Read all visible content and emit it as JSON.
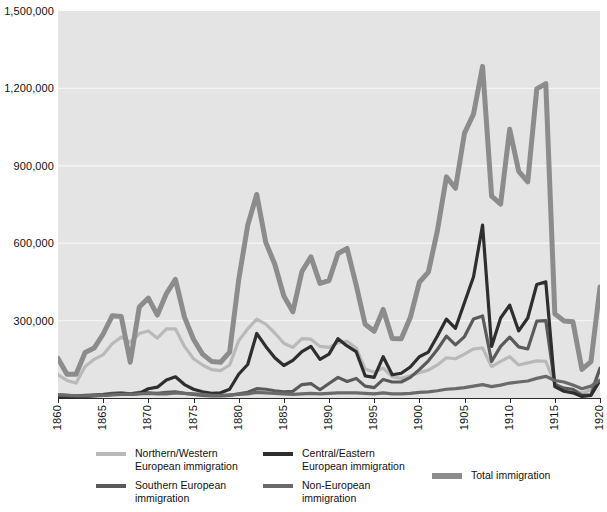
{
  "chart_data": {
    "type": "line",
    "title": "",
    "subtitle": "",
    "xlabel": "",
    "ylabel": "",
    "xlim": [
      1860,
      1920
    ],
    "ylim": [
      0,
      1500000
    ],
    "grid": "horizontal",
    "legend_position": "bottom",
    "y_ticks": [
      0,
      300000,
      600000,
      900000,
      1200000,
      1500000
    ],
    "y_tick_labels": [
      "",
      "300,000",
      "600,000",
      "900,000",
      "1,200,000",
      "1,500,000"
    ],
    "x_ticks": [
      1860,
      1865,
      1870,
      1875,
      1880,
      1885,
      1890,
      1895,
      1900,
      1905,
      1910,
      1915,
      1920
    ],
    "x_tick_labels": [
      "1860",
      "1865",
      "1870",
      "1875",
      "1880",
      "1885",
      "1890",
      "1895",
      "1900",
      "1905",
      "1910",
      "1915",
      "1920"
    ],
    "x": [
      1860,
      1861,
      1862,
      1863,
      1864,
      1865,
      1866,
      1867,
      1868,
      1869,
      1870,
      1871,
      1872,
      1873,
      1874,
      1875,
      1876,
      1877,
      1878,
      1879,
      1880,
      1881,
      1882,
      1883,
      1884,
      1885,
      1886,
      1887,
      1888,
      1889,
      1890,
      1891,
      1892,
      1893,
      1894,
      1895,
      1896,
      1897,
      1898,
      1899,
      1900,
      1901,
      1902,
      1903,
      1904,
      1905,
      1906,
      1907,
      1908,
      1909,
      1910,
      1911,
      1912,
      1913,
      1914,
      1915,
      1916,
      1917,
      1918,
      1919,
      1920
    ],
    "series": [
      {
        "name": "Northern/Western European immigration",
        "color": "#b9b9b9",
        "width": 3.2,
        "values": [
          90000,
          68000,
          58000,
          122000,
          150000,
          168000,
          210000,
          236000,
          216000,
          250000,
          260000,
          232000,
          268000,
          268000,
          200000,
          152000,
          128000,
          110000,
          106000,
          128000,
          222000,
          268000,
          306000,
          286000,
          252000,
          212000,
          196000,
          230000,
          228000,
          200000,
          196000,
          214000,
          220000,
          194000,
          112000,
          100000,
          116000,
          82000,
          76000,
          86000,
          98000,
          108000,
          128000,
          156000,
          152000,
          170000,
          190000,
          194000,
          122000,
          142000,
          160000,
          128000,
          136000,
          144000,
          142000,
          56000,
          34000,
          32000,
          18000,
          32000,
          112000
        ],
        "peak_year": 1882,
        "peak_value": 306000
      },
      {
        "name": "Southern European immigration",
        "color": "#5a5a5a",
        "width": 3.2,
        "values": [
          12000,
          10000,
          8000,
          10000,
          12000,
          14000,
          18000,
          20000,
          16000,
          22000,
          20000,
          18000,
          22000,
          24000,
          18000,
          14000,
          10000,
          8000,
          8000,
          10000,
          16000,
          22000,
          36000,
          34000,
          28000,
          24000,
          26000,
          52000,
          56000,
          32000,
          56000,
          80000,
          64000,
          76000,
          46000,
          40000,
          72000,
          62000,
          62000,
          80000,
          110000,
          144000,
          188000,
          240000,
          206000,
          238000,
          306000,
          318000,
          142000,
          200000,
          236000,
          198000,
          190000,
          298000,
          300000,
          52000,
          38000,
          34000,
          10000,
          12000,
          116000
        ],
        "peak_year": 1907,
        "peak_value": 318000
      },
      {
        "name": "Central/Eastern European immigration",
        "color": "#2e2e2e",
        "width": 3.2,
        "values": [
          6000,
          5000,
          4000,
          6000,
          8000,
          10000,
          14000,
          16000,
          14000,
          18000,
          36000,
          42000,
          70000,
          82000,
          52000,
          34000,
          24000,
          18000,
          20000,
          34000,
          92000,
          130000,
          250000,
          200000,
          156000,
          126000,
          146000,
          180000,
          200000,
          150000,
          170000,
          230000,
          202000,
          180000,
          86000,
          80000,
          160000,
          90000,
          96000,
          120000,
          160000,
          178000,
          240000,
          306000,
          270000,
          370000,
          470000,
          670000,
          200000,
          310000,
          360000,
          260000,
          310000,
          440000,
          450000,
          44000,
          26000,
          20000,
          6000,
          10000,
          68000
        ],
        "peak_year": 1907,
        "peak_value": 670000
      },
      {
        "name": "Non-European immigration",
        "color": "#6a6a6a",
        "width": 3.2,
        "values": [
          12000,
          10000,
          8000,
          8000,
          10000,
          10000,
          12000,
          14000,
          14000,
          16000,
          18000,
          16000,
          16000,
          20000,
          18000,
          16000,
          14000,
          10000,
          10000,
          12000,
          14000,
          16000,
          22000,
          20000,
          18000,
          16000,
          14000,
          16000,
          18000,
          16000,
          18000,
          20000,
          20000,
          20000,
          18000,
          16000,
          20000,
          16000,
          16000,
          18000,
          22000,
          24000,
          28000,
          34000,
          36000,
          40000,
          46000,
          52000,
          44000,
          50000,
          58000,
          62000,
          66000,
          76000,
          84000,
          68000,
          62000,
          50000,
          36000,
          46000,
          68000
        ],
        "peak_year": 1914,
        "peak_value": 84000
      },
      {
        "name": "Total immigration",
        "color": "#8c8c8c",
        "width": 5.0,
        "values": [
          153640,
          91918,
          91985,
          176282,
          193418,
          248120,
          318568,
          315722,
          138840,
          352768,
          387203,
          321350,
          404806,
          459803,
          313339,
          227498,
          169986,
          141857,
          138469,
          177826,
          457257,
          669431,
          788992,
          603322,
          518592,
          395346,
          334203,
          490109,
          546889,
          444427,
          455302,
          560319,
          579663,
          439730,
          285631,
          258536,
          343267,
          230832,
          229299,
          311715,
          448572,
          487918,
          648743,
          857046,
          812870,
          1026499,
          1100735,
          1285349,
          782870,
          751786,
          1041570,
          878587,
          838172,
          1197892,
          1218480,
          326700,
          298826,
          295403,
          110618,
          141132,
          430001
        ],
        "peak_year": 1907,
        "peak_value": 1285349
      }
    ]
  },
  "legend": {
    "items": [
      {
        "label": "Northern/Western\nEuropean immigration",
        "color": "#b9b9b9",
        "thick": false
      },
      {
        "label": "Central/Eastern\nEuropean immigration",
        "color": "#2e2e2e",
        "thick": false
      },
      {
        "label": "Total immigration",
        "color": "#8c8c8c",
        "thick": true
      },
      {
        "label": "Southern European\nimmigration",
        "color": "#5a5a5a",
        "thick": false
      },
      {
        "label": "Non-European\nimmigration",
        "color": "#6a6a6a",
        "thick": false
      }
    ]
  },
  "colors": {
    "plot_background": "#e4e4e4",
    "gridline": "#f4f4f4",
    "axis": "#2b2b2b",
    "text": "#111111"
  }
}
